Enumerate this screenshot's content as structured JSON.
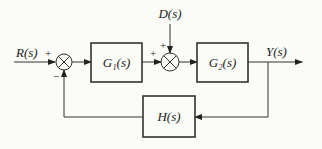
{
  "diagram": {
    "type": "feedback-control-block-diagram",
    "signals": {
      "input": "R(s)",
      "disturbance": "D(s)",
      "output": "Y(s)"
    },
    "blocks": [
      {
        "id": "g1",
        "label": "G₁(s)"
      },
      {
        "id": "g2",
        "label": "G₂(s)"
      },
      {
        "id": "h",
        "label": "H(s)"
      }
    ],
    "junctions": [
      {
        "id": "sum1",
        "signs": {
          "reference": "+",
          "feedback": "−"
        }
      },
      {
        "id": "sum2",
        "signs": {
          "forward": "+",
          "disturbance": "+"
        }
      }
    ]
  }
}
